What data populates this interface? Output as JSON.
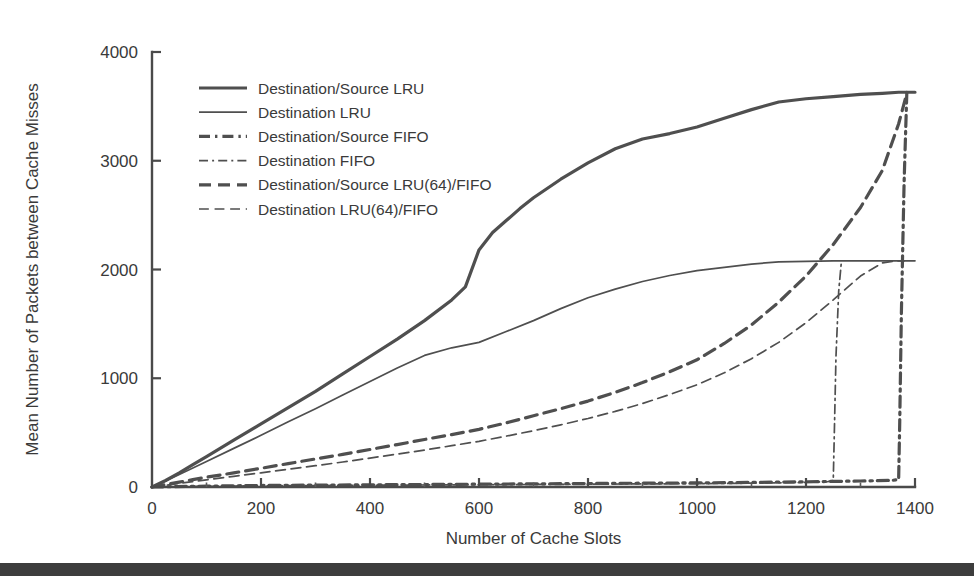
{
  "figure": {
    "background_color": "#ffffff",
    "ink_color": "#4a4a4a",
    "bottom_band_color": "#3d3d3d"
  },
  "chart_data": {
    "type": "line",
    "title": "",
    "xlabel": "Number of Cache Slots",
    "ylabel": "Mean Number of Packets between Cache Misses",
    "xlim": [
      0,
      1400
    ],
    "ylim": [
      0,
      4000
    ],
    "xticks": [
      0,
      200,
      400,
      600,
      800,
      1000,
      1200,
      1400
    ],
    "xtick_labels": [
      "0",
      "200",
      "400",
      "600",
      "800",
      "1000",
      "1200",
      "1400"
    ],
    "yticks": [
      0,
      1000,
      2000,
      3000,
      4000
    ],
    "ytick_labels": [
      "0",
      "1000",
      "2000",
      "3000",
      "4000"
    ],
    "x_minor_tick_interval": 100,
    "grid": false,
    "legend_position": "upper-left-inside",
    "series": [
      {
        "name": "Destination/Source LRU",
        "style": "solid",
        "width": 3.2,
        "color": "#4f4f4f",
        "x": [
          0,
          25,
          50,
          75,
          100,
          150,
          200,
          250,
          300,
          350,
          400,
          450,
          500,
          550,
          575,
          600,
          625,
          650,
          675,
          700,
          750,
          800,
          850,
          900,
          950,
          1000,
          1050,
          1100,
          1150,
          1200,
          1250,
          1300,
          1340,
          1370,
          1400
        ],
        "y": [
          0,
          60,
          130,
          205,
          280,
          430,
          580,
          730,
          880,
          1040,
          1200,
          1360,
          1530,
          1720,
          1840,
          2180,
          2340,
          2450,
          2560,
          2660,
          2830,
          2980,
          3110,
          3200,
          3250,
          3310,
          3390,
          3470,
          3540,
          3570,
          3590,
          3610,
          3620,
          3630,
          3630
        ]
      },
      {
        "name": "Destination LRU",
        "style": "solid",
        "width": 1.7,
        "color": "#4f4f4f",
        "x": [
          0,
          25,
          50,
          75,
          100,
          150,
          200,
          250,
          300,
          350,
          400,
          450,
          500,
          550,
          600,
          650,
          700,
          750,
          800,
          850,
          900,
          950,
          1000,
          1050,
          1100,
          1150,
          1200,
          1250,
          1300,
          1340,
          1370,
          1400
        ],
        "y": [
          0,
          55,
          115,
          175,
          235,
          355,
          475,
          600,
          720,
          845,
          970,
          1095,
          1210,
          1280,
          1330,
          1430,
          1530,
          1640,
          1740,
          1820,
          1890,
          1945,
          1990,
          2020,
          2050,
          2070,
          2075,
          2080,
          2080,
          2080,
          2080,
          2080
        ]
      },
      {
        "name": "Destination/Source FIFO",
        "style": "dash-dot-dash",
        "width": 3.2,
        "color": "#4f4f4f",
        "x": [
          0,
          100,
          200,
          400,
          600,
          800,
          1000,
          1100,
          1200,
          1300,
          1360,
          1370,
          1372,
          1375,
          1380,
          1385
        ],
        "y": [
          0,
          8,
          14,
          20,
          26,
          32,
          38,
          42,
          48,
          55,
          62,
          70,
          600,
          1600,
          2800,
          3630
        ]
      },
      {
        "name": "Destination FIFO",
        "style": "dash-dot-dash",
        "width": 1.7,
        "color": "#4f4f4f",
        "x": [
          0,
          100,
          200,
          400,
          600,
          800,
          1000,
          1100,
          1200,
          1240,
          1250,
          1252,
          1255,
          1260,
          1265
        ],
        "y": [
          0,
          6,
          11,
          16,
          21,
          26,
          31,
          35,
          42,
          50,
          60,
          500,
          1200,
          1800,
          2075
        ]
      },
      {
        "name": "Destination/Source LRU(64)/FIFO",
        "style": "dashed",
        "width": 3.2,
        "color": "#4f4f4f",
        "x": [
          0,
          25,
          50,
          75,
          100,
          150,
          200,
          250,
          300,
          350,
          400,
          450,
          500,
          550,
          600,
          650,
          700,
          750,
          800,
          850,
          900,
          950,
          1000,
          1050,
          1100,
          1150,
          1200,
          1250,
          1300,
          1340,
          1370,
          1385
        ],
        "y": [
          0,
          22,
          45,
          68,
          90,
          130,
          172,
          215,
          258,
          300,
          345,
          390,
          437,
          482,
          530,
          590,
          655,
          720,
          790,
          870,
          960,
          1060,
          1170,
          1320,
          1490,
          1700,
          1940,
          2230,
          2570,
          2910,
          3340,
          3620
        ]
      },
      {
        "name": "Destination LRU(64)/FIFO",
        "style": "dashed",
        "width": 1.7,
        "color": "#4f4f4f",
        "x": [
          0,
          25,
          50,
          75,
          100,
          150,
          200,
          250,
          300,
          350,
          400,
          450,
          500,
          550,
          600,
          650,
          700,
          750,
          800,
          850,
          900,
          950,
          1000,
          1050,
          1100,
          1150,
          1200,
          1250,
          1300,
          1340,
          1365,
          1380
        ],
        "y": [
          0,
          16,
          33,
          50,
          66,
          98,
          130,
          163,
          196,
          230,
          266,
          302,
          340,
          380,
          420,
          468,
          518,
          572,
          630,
          695,
          768,
          850,
          940,
          1050,
          1180,
          1330,
          1510,
          1720,
          1940,
          2060,
          2080,
          2080
        ]
      }
    ]
  },
  "legend": {
    "items": [
      {
        "label": "Destination/Source LRU",
        "style": "solid",
        "width": 3.2
      },
      {
        "label": "Destination LRU",
        "style": "solid",
        "width": 1.7
      },
      {
        "label": "Destination/Source FIFO",
        "style": "dash-dot-dash",
        "width": 3.2
      },
      {
        "label": "Destination FIFO",
        "style": "dash-dot-dash",
        "width": 1.7
      },
      {
        "label": "Destination/Source LRU(64)/FIFO",
        "style": "dashed",
        "width": 3.2
      },
      {
        "label": "Destination LRU(64)/FIFO",
        "style": "dashed",
        "width": 1.7
      }
    ]
  }
}
